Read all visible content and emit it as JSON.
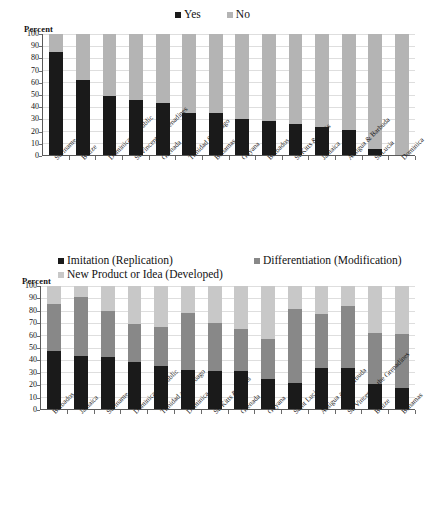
{
  "chart_data": [
    {
      "type": "bar",
      "id": "chart-one",
      "title": "",
      "ylabel": "Percent",
      "xlabel": "",
      "ylim": [
        0,
        100
      ],
      "ytick_labels": [
        "0",
        "10",
        "20",
        "30",
        "40",
        "50",
        "60",
        "70",
        "80",
        "90",
        "100"
      ],
      "grid": true,
      "stacked": true,
      "legend_position": "top-center",
      "legend": [
        "Yes",
        "No"
      ],
      "colors": [
        "#1a1a1a",
        "#b4b4b4"
      ],
      "categories": [
        "Suriname",
        "Belize",
        "Dominican Republic",
        "St Vincent & Grenadines",
        "Grenada",
        "Trinidad & Tobago",
        "Bahamas",
        "Guyana",
        "Barbados",
        "St Kitts & Nevis",
        "Jamaica",
        "Antigua & Barbuda",
        "St Lucia",
        "Dominica"
      ],
      "series": [
        {
          "name": "Yes",
          "values": [
            85.5,
            62,
            49,
            45.5,
            43,
            35,
            34.5,
            29.5,
            28,
            26,
            23,
            21,
            5,
            0
          ]
        },
        {
          "name": "No",
          "values": [
            14.5,
            38,
            51,
            54.5,
            57,
            65,
            65.5,
            70.5,
            72,
            74,
            77,
            79,
            95,
            100
          ]
        }
      ]
    },
    {
      "type": "bar",
      "id": "chart-two",
      "title": "",
      "ylabel": "Percent",
      "xlabel": "",
      "ylim": [
        0,
        100
      ],
      "ytick_labels": [
        "0",
        "10",
        "20",
        "30",
        "40",
        "50",
        "60",
        "70",
        "80",
        "90",
        "100"
      ],
      "grid": true,
      "stacked": true,
      "legend_position": "top",
      "legend": [
        "Imitation (Replication)",
        "Differentiation (Modification)",
        "New Product or Idea (Developed)"
      ],
      "colors": [
        "#1a1a1a",
        "#888888",
        "#c8c8c8"
      ],
      "categories": [
        "Barbados",
        "Jamaica",
        "Suriname",
        "Dominican Republic",
        "Trinidad and Tobago",
        "Dominica",
        "St. Kitts & Nevis",
        "Grenada",
        "Guyana",
        "Saint Lucia",
        "Antigua and Barbuda",
        "St. Vincent & the Grenadines",
        "Belize",
        "Bahamas"
      ],
      "series": [
        {
          "name": "Imitation (Replication)",
          "values": [
            47,
            43,
            42,
            38,
            35,
            32,
            31,
            31,
            24,
            21,
            33,
            33,
            20,
            17
          ]
        },
        {
          "name": "Differentiation (Modification)",
          "values": [
            38,
            48,
            38,
            31,
            32,
            46,
            39,
            34,
            33,
            60,
            44,
            51,
            42,
            44
          ]
        },
        {
          "name": "New Product or Idea (Developed)",
          "values": [
            15,
            9,
            20,
            31,
            33,
            22,
            30,
            35,
            43,
            19,
            23,
            16,
            38,
            39
          ]
        }
      ]
    }
  ]
}
